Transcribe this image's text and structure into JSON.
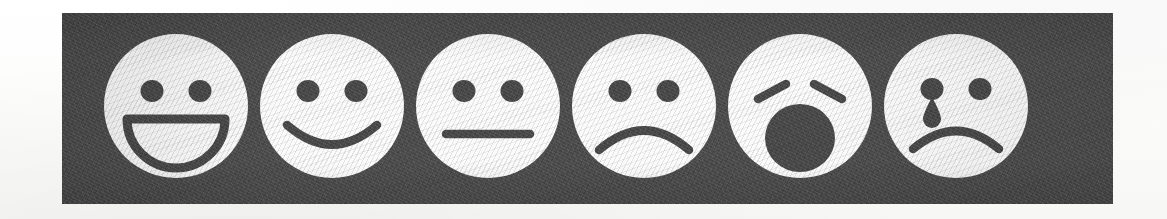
{
  "page": {
    "background_color": "#fdfdfc",
    "strip_color": "#4b4b4b",
    "face_color": "#fbfbfb",
    "ink_color": "#474747",
    "face_count": 6
  },
  "scale": {
    "name": "six-point-facial-expression-scale",
    "orientation": "horizontal",
    "faces": [
      {
        "index": 1,
        "icon": "grinning-face-icon",
        "label": "Very happy",
        "mouth": "open-grin",
        "eyes": "round-dots",
        "extras": "none",
        "value": 1
      },
      {
        "index": 2,
        "icon": "smiling-face-icon",
        "label": "Happy",
        "mouth": "smile-curve",
        "eyes": "round-dots",
        "extras": "none",
        "value": 2
      },
      {
        "index": 3,
        "icon": "neutral-face-icon",
        "label": "Neutral",
        "mouth": "straight-line",
        "eyes": "round-dots",
        "extras": "none",
        "value": 3
      },
      {
        "index": 4,
        "icon": "frowning-face-icon",
        "label": "Sad",
        "mouth": "frown-curve",
        "eyes": "round-dots",
        "extras": "none",
        "value": 4
      },
      {
        "index": 5,
        "icon": "shocked-face-icon",
        "label": "Shocked",
        "mouth": "open-round-mouth",
        "eyes": "slanted-brow-lines",
        "extras": "none",
        "value": 5
      },
      {
        "index": 6,
        "icon": "crying-face-icon",
        "label": "Crying",
        "mouth": "frown-curve",
        "eyes": "round-dots",
        "extras": "teardrop",
        "value": 6
      }
    ]
  }
}
